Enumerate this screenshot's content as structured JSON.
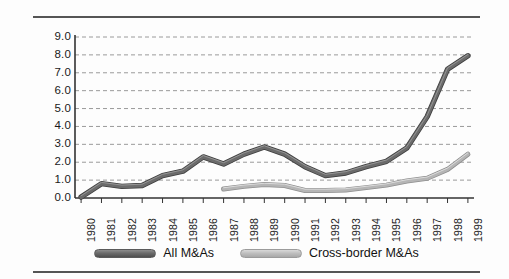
{
  "chart_data": {
    "type": "line",
    "title": "",
    "subtitle": "",
    "xlabel": "",
    "ylabel": "",
    "categories": [
      "1980",
      "1981",
      "1982",
      "1983",
      "1984",
      "1985",
      "1986",
      "1987",
      "1988",
      "1989",
      "1990",
      "1991",
      "1992",
      "1993",
      "1994",
      "1995",
      "1996",
      "1997",
      "1998",
      "1999"
    ],
    "ylim": [
      0.0,
      9.0
    ],
    "ytick_step": 1.0,
    "ytick_labels": [
      "9.0",
      "8.0",
      "7.0",
      "6.0",
      "5.0",
      "4.0",
      "3.0",
      "2.0",
      "1.0",
      "0.0"
    ],
    "ytick_values": [
      9.0,
      8.0,
      7.0,
      6.0,
      5.0,
      4.0,
      3.0,
      2.0,
      1.0,
      0.0
    ],
    "grid": true,
    "grid_style": "dashed-horizontal",
    "legend_position": "bottom-center",
    "series": [
      {
        "name": "All M&As",
        "color": "#6b6b6b",
        "values": [
          0.05,
          0.8,
          0.65,
          0.7,
          1.25,
          1.5,
          2.3,
          1.9,
          2.45,
          2.85,
          2.45,
          1.75,
          1.25,
          1.4,
          1.75,
          2.05,
          2.8,
          4.55,
          7.2,
          7.95
        ]
      },
      {
        "name": "Cross-border M&As",
        "color": "#b5b5b5",
        "values": [
          null,
          null,
          null,
          null,
          null,
          null,
          null,
          0.5,
          0.65,
          0.75,
          0.7,
          0.42,
          0.42,
          0.45,
          0.58,
          0.72,
          0.95,
          1.1,
          1.6,
          2.45
        ]
      }
    ]
  },
  "legend": {
    "items": [
      {
        "label": "All M&As",
        "color": "#6b6b6b"
      },
      {
        "label": "Cross-border M&As",
        "color": "#b5b5b5"
      }
    ]
  },
  "colors": {
    "all_mas": "#6b6b6b",
    "cross_border_mas": "#b5b5b5",
    "grid": "#9a9a9a",
    "axis": "#333333",
    "text": "#1a1a1a",
    "background": "#fdfdfd"
  }
}
